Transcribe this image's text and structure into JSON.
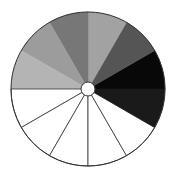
{
  "diagram": {
    "type": "grayscale-wheel",
    "center": [
      88,
      89
    ],
    "radius": 77,
    "hub_radius": 7,
    "outline_color": "#333333",
    "hub_fill": "#ffffff",
    "wedges": [
      {
        "start_deg": 0,
        "end_deg": 30,
        "fill": "#080808"
      },
      {
        "start_deg": 30,
        "end_deg": 60,
        "fill": "#555555"
      },
      {
        "start_deg": 60,
        "end_deg": 90,
        "fill": "#a2a2a2"
      },
      {
        "start_deg": 90,
        "end_deg": 120,
        "fill": "#777777"
      },
      {
        "start_deg": 120,
        "end_deg": 150,
        "fill": "#9c9c9c"
      },
      {
        "start_deg": 150,
        "end_deg": 180,
        "fill": "#b4b4b4"
      },
      {
        "start_deg": 180,
        "end_deg": 210,
        "fill": "#ffffff"
      },
      {
        "start_deg": 210,
        "end_deg": 240,
        "fill": "#ffffff"
      },
      {
        "start_deg": 240,
        "end_deg": 270,
        "fill": "#ffffff"
      },
      {
        "start_deg": 270,
        "end_deg": 300,
        "fill": "#ffffff"
      },
      {
        "start_deg": 300,
        "end_deg": 330,
        "fill": "#ffffff"
      },
      {
        "start_deg": 330,
        "end_deg": 360,
        "fill": "#1a1a1a"
      }
    ]
  }
}
